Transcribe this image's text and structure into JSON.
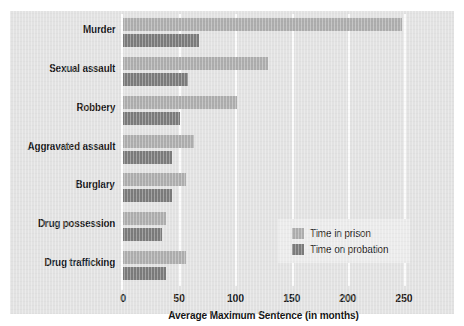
{
  "chart_data": {
    "type": "bar",
    "orientation": "horizontal",
    "title": "",
    "xlabel": "Average Maximum Sentence (in months)",
    "ylabel": "",
    "xlim": [
      0,
      250
    ],
    "xticks": [
      0,
      50,
      100,
      150,
      200,
      250
    ],
    "xtick_labels": [
      "0",
      "50",
      "100",
      "150",
      "200",
      "250"
    ],
    "grid": "vertical-white-gridlines",
    "legend_position": "inside-lower-right",
    "categories": [
      "Murder",
      "Sexual assault",
      "Robbery",
      "Aggravated assault",
      "Burglary",
      "Drug possession",
      "Drug trafficking"
    ],
    "series": [
      {
        "name": "Time in prison",
        "color": "#adadad",
        "values": [
          248,
          129,
          101,
          63,
          56,
          38,
          56
        ]
      },
      {
        "name": "Time on probation",
        "color": "#7b7b7b",
        "values": [
          68,
          58,
          51,
          44,
          44,
          35,
          38
        ]
      }
    ],
    "colors": {
      "background": "#e2e2e2",
      "gridline": "#fbfbfb",
      "legend_background": "#ebebeb",
      "text": "#1b1b1b"
    }
  },
  "legend": {
    "items": [
      {
        "label": "Time in prison"
      },
      {
        "label": "Time on probation"
      }
    ]
  }
}
